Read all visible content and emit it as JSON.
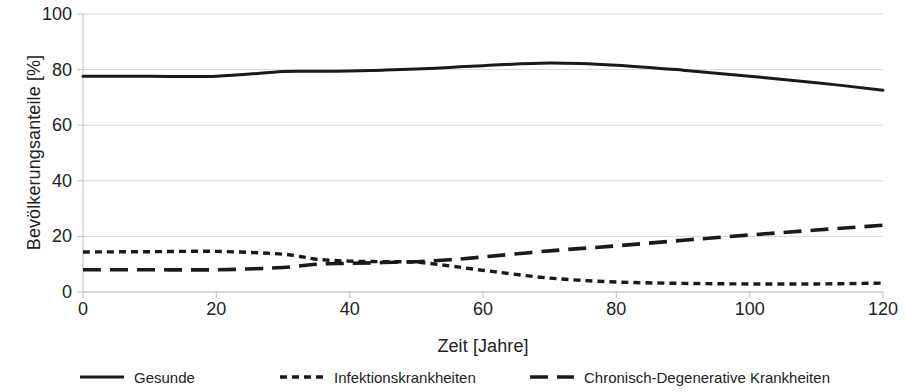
{
  "chart_data": {
    "type": "line",
    "title": "",
    "subtitle": "",
    "xlabel": "Zeit [Jahre]",
    "ylabel": "Bevölkerungsanteile [%]",
    "xlim": [
      0,
      120
    ],
    "ylim": [
      0,
      100
    ],
    "xticks": [
      0,
      20,
      40,
      60,
      80,
      100,
      120
    ],
    "yticks": [
      0,
      20,
      40,
      60,
      80,
      100
    ],
    "grid": "horizontal",
    "legend_position": "bottom",
    "x": [
      0,
      10,
      20,
      30,
      35,
      40,
      45,
      50,
      55,
      60,
      70,
      80,
      90,
      100,
      110,
      120
    ],
    "series": [
      {
        "name": "Gesunde",
        "style": "solid",
        "color": "#1a1a1a",
        "values": [
          77.6,
          77.6,
          77.6,
          79.3,
          79.4,
          79.5,
          79.8,
          80.2,
          80.8,
          81.4,
          82.4,
          81.6,
          79.8,
          77.6,
          75.3,
          72.6
        ]
      },
      {
        "name": "Infektionskrankheiten",
        "style": "dotted",
        "color": "#1a1a1a",
        "values": [
          14.4,
          14.5,
          14.6,
          13.6,
          11.8,
          11.1,
          10.9,
          10.7,
          9.4,
          7.8,
          5.0,
          3.6,
          3.1,
          2.9,
          2.9,
          3.2
        ]
      },
      {
        "name": "Chronisch-Degenerative Krankheiten",
        "style": "dashed",
        "color": "#1a1a1a",
        "values": [
          8.0,
          8.0,
          8.0,
          8.8,
          10.0,
          10.3,
          10.6,
          10.9,
          11.6,
          12.6,
          14.8,
          16.6,
          18.6,
          20.5,
          22.3,
          24.0
        ]
      }
    ]
  },
  "axis": {
    "y_title": "Bevölkerungsanteile [%]",
    "x_title": "Zeit [Jahre]",
    "y_tick_labels": [
      "100",
      "80",
      "60",
      "40",
      "20",
      "0"
    ],
    "x_tick_labels": [
      "0",
      "20",
      "40",
      "60",
      "80",
      "100",
      "120"
    ]
  },
  "legend": {
    "items": [
      {
        "label": "Gesunde",
        "swatch": "solid-line-icon"
      },
      {
        "label": "Infektionskrankheiten",
        "swatch": "dotted-line-icon"
      },
      {
        "label": "Chronisch-Degenerative Krankheiten",
        "swatch": "dashed-line-icon"
      }
    ]
  },
  "colors": {
    "line": "#1a1a1a",
    "grid": "#d9d9d9",
    "axis": "#bfbfbf",
    "text": "#222222",
    "background": "#ffffff"
  }
}
